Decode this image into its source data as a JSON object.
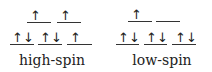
{
  "diagram": {
    "type": "d-orbital electron configuration",
    "panels": [
      {
        "label": "high-spin",
        "upper_levels": [
          [
            "up"
          ],
          [
            "up"
          ]
        ],
        "lower_levels": [
          [
            "up",
            "down"
          ],
          [
            "up",
            "down"
          ],
          [
            "up"
          ]
        ]
      },
      {
        "label": "low-spin",
        "upper_levels": [
          [
            "up"
          ],
          []
        ],
        "lower_levels": [
          [
            "up",
            "down"
          ],
          [
            "up",
            "down"
          ],
          [
            "up",
            "down"
          ]
        ]
      }
    ],
    "arrows": {
      "up": "↑",
      "down": "↓"
    }
  }
}
